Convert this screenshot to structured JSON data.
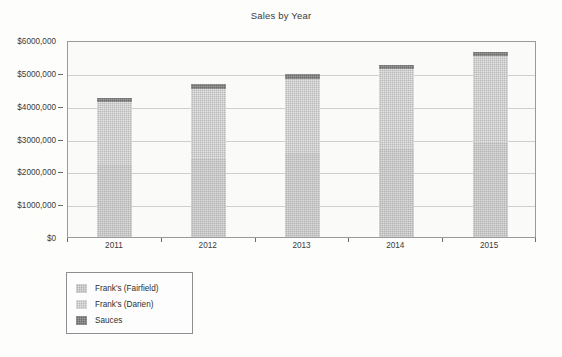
{
  "chart_data": {
    "type": "bar",
    "subtype": "stacked-column",
    "title": "Sales by Year",
    "xlabel": "",
    "ylabel": "",
    "categories": [
      "2011",
      "2012",
      "2013",
      "2014",
      "2015"
    ],
    "series": [
      {
        "name": "Frank's (Fairfield)",
        "color": "#b4b4b4",
        "values": [
          2200000,
          2400000,
          2550000,
          2700000,
          2900000
        ]
      },
      {
        "name": "Frank's (Darien)",
        "color": "#b9b9b9",
        "values": [
          1900000,
          2110000,
          2260000,
          2410000,
          2610000
        ]
      },
      {
        "name": "Sauces",
        "color": "#6e6e6e",
        "values": [
          140000,
          140000,
          140000,
          140000,
          140000
        ]
      }
    ],
    "totals": [
      4240000,
      4650000,
      4950000,
      5250000,
      5650000
    ],
    "ylim": [
      0,
      6000000
    ],
    "ytick_values": [
      0,
      1000000,
      2000000,
      3000000,
      4000000,
      5000000,
      6000000
    ],
    "ytick_labels": [
      "$0",
      "$1000,000",
      "$2000,000",
      "$3000,000",
      "$4000,000",
      "$5000,000",
      "$6000,000"
    ],
    "grid": true,
    "grid_axis": "y",
    "legend_position": "below-left"
  },
  "chart": {
    "title": "Sales by Year"
  },
  "legend": {
    "items": [
      {
        "label": "Frank's (Fairfield)",
        "swatch": "legend-swatch-fairfield"
      },
      {
        "label": "Frank's (Darien)",
        "swatch": "legend-swatch-darien"
      },
      {
        "label": "Sauces",
        "swatch": "legend-swatch-sauces"
      }
    ]
  },
  "colors": {
    "fairfield": "#b4b4b4",
    "darien": "#b9b9b9",
    "sauces": "#6e6e6e",
    "plot_background": "#fafaf9",
    "gridline": "#cfcfcf",
    "axis": "#9a9a9a",
    "text": "#3a3a3a"
  }
}
